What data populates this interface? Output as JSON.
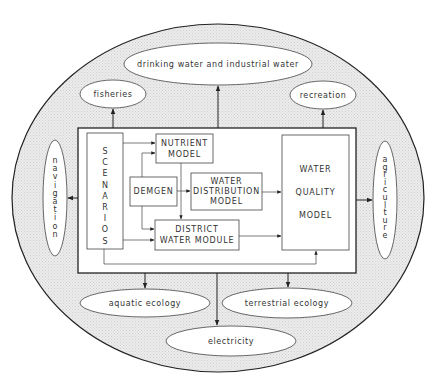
{
  "diagram": {
    "type": "system-flow",
    "colors": {
      "background": "#ffffff",
      "outer_fill": "#e6e6e6",
      "stroke": "#222222",
      "text": "#333333"
    },
    "core_system": {
      "scenarios": {
        "label": "SCENARIOS",
        "letters": [
          "S",
          "C",
          "E",
          "N",
          "A",
          "R",
          "I",
          "O",
          "S"
        ]
      },
      "nutrient_model": {
        "line1": "NUTRIENT",
        "line2": "MODEL"
      },
      "demgen": {
        "label": "DEMGEN"
      },
      "water_distribution_model": {
        "line1": "WATER",
        "line2": "DISTRIBUTION",
        "line3": "MODEL"
      },
      "district_water_module": {
        "line1": "DISTRICT",
        "line2": "WATER MODULE"
      },
      "water_quality_model": {
        "line1": "WATER",
        "line2": "QUALITY",
        "line3": "MODEL"
      }
    },
    "outputs": {
      "drinking_water": "drinking water and industrial water",
      "fisheries": "fisheries",
      "recreation": "recreation",
      "navigation": {
        "label": "navigation",
        "letters": [
          "n",
          "a",
          "v",
          "i",
          "g",
          "a",
          "t",
          "i",
          "o",
          "n"
        ]
      },
      "agriculture": {
        "label": "agriculture",
        "letters": [
          "a",
          "g",
          "r",
          "i",
          "c",
          "u",
          "l",
          "t",
          "u",
          "r",
          "e"
        ]
      },
      "aquatic_ecology": "aquatic ecology",
      "terrestrial_ecology": "terrestrial ecology",
      "electricity": "electricity"
    },
    "edges": [
      {
        "from": "SCENARIOS",
        "to": "NUTRIENT MODEL"
      },
      {
        "from": "SCENARIOS",
        "to": "DISTRICT WATER MODULE"
      },
      {
        "from": "SCENARIOS",
        "to": "WATER QUALITY MODEL"
      },
      {
        "from": "DEMGEN",
        "to": "NUTRIENT MODEL"
      },
      {
        "from": "DEMGEN",
        "to": "WATER DISTRIBUTION MODEL"
      },
      {
        "from": "DEMGEN",
        "to": "DISTRICT WATER MODULE"
      },
      {
        "from": "NUTRIENT MODEL",
        "to": "DISTRICT WATER MODULE"
      },
      {
        "from": "WATER DISTRIBUTION MODEL",
        "to": "WATER QUALITY MODEL"
      },
      {
        "from": "DISTRICT WATER MODULE",
        "to": "WATER QUALITY MODEL"
      },
      {
        "from": "core system",
        "to": "drinking water and industrial water"
      },
      {
        "from": "core system",
        "to": "fisheries"
      },
      {
        "from": "core system",
        "to": "recreation"
      },
      {
        "from": "core system",
        "to": "navigation"
      },
      {
        "from": "core system",
        "to": "agriculture"
      },
      {
        "from": "core system",
        "to": "aquatic ecology"
      },
      {
        "from": "core system",
        "to": "terrestrial ecology"
      },
      {
        "from": "core system",
        "to": "electricity"
      }
    ]
  }
}
